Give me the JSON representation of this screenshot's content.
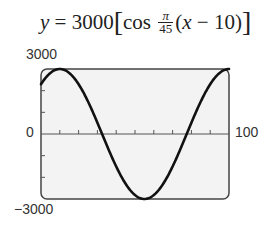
{
  "equation": {
    "lhs": "y",
    "eq": " = 3000",
    "cos": "cos",
    "frac_num": "π",
    "frac_den": "45",
    "arg_open": "(",
    "arg_var": "x",
    "arg_rest": " − 10)"
  },
  "axis_labels": {
    "ymax": "3000",
    "ymin": "−3000",
    "xmin": "0",
    "xmax": "100"
  },
  "chart_data": {
    "type": "line",
    "xlabel": "",
    "ylabel": "",
    "xlim": [
      0,
      100
    ],
    "ylim": [
      -3000,
      3000
    ],
    "x_tick_interval": 10,
    "y_tick_interval": 1000,
    "grid": false,
    "series": [
      {
        "name": "y = 3000 cos(π/45 (x − 10))",
        "x": [
          0,
          10,
          20,
          32.5,
          40,
          55,
          70,
          77.5,
          90,
          100
        ],
        "y": [
          2819,
          3000,
          2819,
          0,
          -1500,
          -3000,
          -1500,
          0,
          2298,
          3000
        ]
      }
    ],
    "colors": {
      "curve": "#111111",
      "frame": "#444444",
      "background": "#f3f3f3"
    }
  }
}
